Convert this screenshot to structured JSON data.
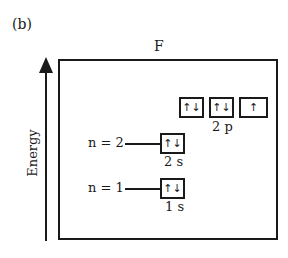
{
  "panel_label": "(b)",
  "element": "F",
  "axis": {
    "label": "Energy",
    "icon": "up-arrow-icon"
  },
  "levels": [
    {
      "label": "n = 1",
      "orbital": "1 s",
      "electrons": "↑↓"
    },
    {
      "label": "n = 2",
      "orbital": "2 s",
      "electrons": "↑↓"
    }
  ],
  "p_orbitals": {
    "label": "2 p",
    "boxes": [
      "↑↓",
      "↑↓",
      "↑"
    ]
  },
  "colors": {
    "ink": "#1a1a1a",
    "background": "#ffffff"
  }
}
